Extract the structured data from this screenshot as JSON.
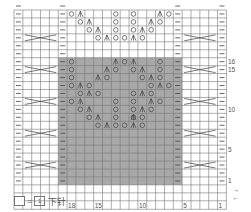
{
  "chart_data": {
    "type": "knitting-chart",
    "columns": 24,
    "rows": 22,
    "column_labels": [
      {
        "col": 18,
        "label": "18"
      },
      {
        "col": 15,
        "label": "15"
      },
      {
        "col": 10,
        "label": "10"
      },
      {
        "col": 5,
        "label": "5"
      },
      {
        "col": 1,
        "label": "1"
      }
    ],
    "row_labels": [
      {
        "row": 16,
        "label": "16"
      },
      {
        "row": 15,
        "label": "15"
      },
      {
        "row": 10,
        "label": "10"
      },
      {
        "row": 5,
        "label": "5"
      },
      {
        "row": 1,
        "label": "1"
      }
    ],
    "shaded_region": {
      "col_from": 19,
      "col_to": 6,
      "row_from": 1,
      "row_to": 16,
      "color": "#a8a8a8"
    },
    "purl_columns": [
      24,
      19,
      6,
      1
    ],
    "cable_rows": [
      3,
      7,
      11,
      15,
      19
    ],
    "cable_columns": [
      [
        23,
        20
      ],
      [
        5,
        2
      ]
    ],
    "symbols": {
      "purl": "—",
      "yarn_over": "○",
      "decrease": "⋏",
      "cable": "✕"
    },
    "rows_detail": [
      {
        "row": 22,
        "cells": [
          {
            "col": 18,
            "s": "yo"
          },
          {
            "col": 17,
            "s": "dec"
          },
          {
            "col": 13,
            "s": "yo"
          },
          {
            "col": 11,
            "s": "yo"
          },
          {
            "col": 8,
            "s": "dec"
          },
          {
            "col": 7,
            "s": "yo"
          }
        ]
      },
      {
        "row": 21,
        "cells": [
          {
            "col": 17,
            "s": "yo"
          },
          {
            "col": 16,
            "s": "dec"
          },
          {
            "col": 13,
            "s": "yo"
          },
          {
            "col": 11,
            "s": "yo"
          },
          {
            "col": 9,
            "s": "dec"
          },
          {
            "col": 8,
            "s": "yo"
          }
        ]
      },
      {
        "row": 20,
        "cells": [
          {
            "col": 16,
            "s": "yo"
          },
          {
            "col": 15,
            "s": "dec"
          },
          {
            "col": 13,
            "s": "yo"
          },
          {
            "col": 11,
            "s": "yo"
          },
          {
            "col": 10,
            "s": "dec"
          },
          {
            "col": 9,
            "s": "yo"
          }
        ]
      },
      {
        "row": 19,
        "cells": [
          {
            "col": 15,
            "s": "yo"
          },
          {
            "col": 14,
            "s": "dec"
          },
          {
            "col": 13,
            "s": "yo"
          },
          {
            "col": 12,
            "s": "yo"
          },
          {
            "col": 11,
            "s": "dec"
          },
          {
            "col": 10,
            "s": "yo"
          }
        ]
      },
      {
        "row": 16,
        "cells": [
          {
            "col": 18,
            "s": "yo"
          },
          {
            "col": 13,
            "s": "dec"
          },
          {
            "col": 12,
            "s": "yo"
          },
          {
            "col": 11,
            "s": "dec"
          },
          {
            "col": 8,
            "s": "yo"
          }
        ]
      },
      {
        "row": 15,
        "cells": [
          {
            "col": 18,
            "s": "yo"
          },
          {
            "col": 14,
            "s": "dec"
          },
          {
            "col": 13,
            "s": "yo"
          },
          {
            "col": 11,
            "s": "yo"
          },
          {
            "col": 10,
            "s": "dec"
          },
          {
            "col": 8,
            "s": "yo"
          }
        ]
      },
      {
        "row": 14,
        "cells": [
          {
            "col": 18,
            "s": "yo"
          },
          {
            "col": 15,
            "s": "dec"
          },
          {
            "col": 14,
            "s": "yo"
          },
          {
            "col": 10,
            "s": "yo"
          },
          {
            "col": 9,
            "s": "dec"
          },
          {
            "col": 8,
            "s": "yo"
          }
        ]
      },
      {
        "row": 13,
        "cells": [
          {
            "col": 18,
            "s": "yo"
          },
          {
            "col": 17,
            "s": "dec"
          },
          {
            "col": 16,
            "s": "yo"
          },
          {
            "col": 9,
            "s": "yo"
          },
          {
            "col": 8,
            "s": "dec"
          },
          {
            "col": 7,
            "s": "yo"
          }
        ]
      },
      {
        "row": 12,
        "cells": [
          {
            "col": 17,
            "s": "yo"
          },
          {
            "col": 16,
            "s": "dec"
          },
          {
            "col": 15,
            "s": "yo"
          },
          {
            "col": 11,
            "s": "yo"
          },
          {
            "col": 10,
            "s": "dec"
          },
          {
            "col": 9,
            "s": "yo"
          }
        ]
      },
      {
        "row": 11,
        "cells": [
          {
            "col": 18,
            "s": "yo"
          },
          {
            "col": 17,
            "s": "dec"
          },
          {
            "col": 13,
            "s": "yo"
          },
          {
            "col": 11,
            "s": "yo"
          },
          {
            "col": 9,
            "s": "dec"
          },
          {
            "col": 8,
            "s": "yo"
          }
        ]
      },
      {
        "row": 10,
        "cells": [
          {
            "col": 17,
            "s": "yo"
          },
          {
            "col": 16,
            "s": "dec"
          },
          {
            "col": 13,
            "s": "yo"
          },
          {
            "col": 11,
            "s": "yo"
          },
          {
            "col": 10,
            "s": "dec"
          },
          {
            "col": 9,
            "s": "yo"
          }
        ]
      },
      {
        "row": 9,
        "cells": [
          {
            "col": 16,
            "s": "yo"
          },
          {
            "col": 15,
            "s": "dec"
          },
          {
            "col": 13,
            "s": "yo"
          },
          {
            "col": 11,
            "s": "yo"
          },
          {
            "col": 11,
            "s": "dec"
          },
          {
            "col": 10,
            "s": "yo"
          }
        ]
      },
      {
        "row": 8,
        "cells": [
          {
            "col": 15,
            "s": "yo"
          },
          {
            "col": 14,
            "s": "dec"
          },
          {
            "col": 13,
            "s": "yo"
          },
          {
            "col": 12,
            "s": "yo"
          },
          {
            "col": 11,
            "s": "dec"
          },
          {
            "col": 10,
            "s": "yo"
          }
        ]
      }
    ]
  },
  "right_arrows": {
    "top": "→",
    "bottom": "←"
  },
  "legend": {
    "equals": "=",
    "box_number": "1",
    "text": "下针"
  }
}
